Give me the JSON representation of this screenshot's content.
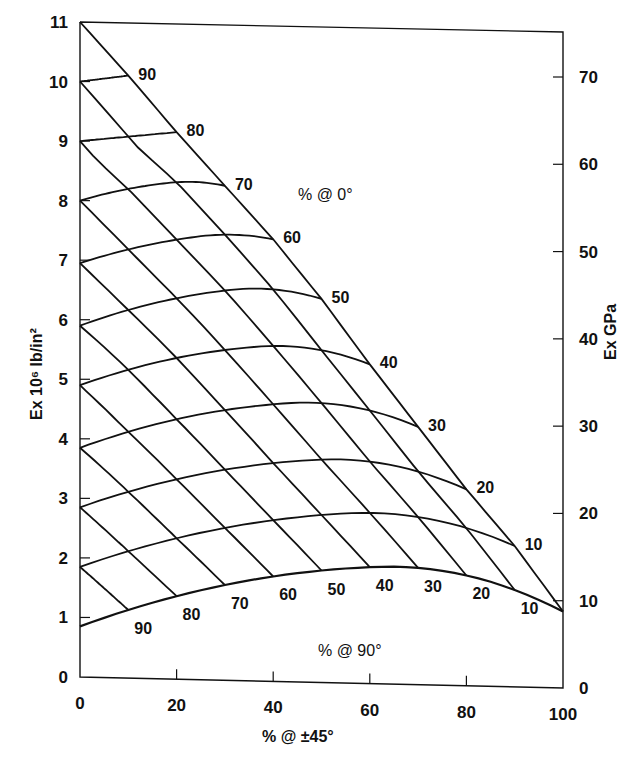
{
  "chart_data": {
    "type": "line",
    "subtype": "carpet-plot",
    "title": "",
    "xlabel": "% @ ±45°",
    "ylabel_left": "Ex 10⁶ lb/in²",
    "ylabel_right": "Ex GPa",
    "xlim": [
      0,
      100
    ],
    "ylim_left": [
      0,
      11
    ],
    "ylim_right": [
      0,
      75
    ],
    "x_ticks": [
      0,
      20,
      40,
      60,
      80,
      100
    ],
    "y_ticks_left": [
      0,
      1,
      2,
      3,
      4,
      5,
      6,
      7,
      8,
      9,
      10,
      11
    ],
    "y_ticks_right": [
      0,
      10,
      20,
      30,
      40,
      50,
      60,
      70
    ],
    "grid": false,
    "region_labels": {
      "zero_deg": "% @ 0°",
      "ninety_deg": "% @ 90°"
    },
    "family_0deg": {
      "name": "% @ 0°",
      "labels": [
        "90",
        "80",
        "70",
        "60",
        "50",
        "40",
        "30",
        "20",
        "10"
      ],
      "values": [
        90,
        80,
        70,
        60,
        50,
        40,
        30,
        20,
        10,
        0
      ],
      "left_intercepts_msi": [
        10.0,
        9.0,
        8.0,
        6.95,
        5.9,
        4.9,
        3.85,
        2.85,
        1.85,
        0.85
      ],
      "edge_values_msi": [
        10.1,
        9.15,
        8.25,
        7.35,
        6.35,
        5.25,
        4.2,
        3.15,
        2.2,
        1.1
      ],
      "peak_values_msi": [
        10.0,
        9.05,
        8.3,
        7.4,
        6.5,
        5.55,
        4.6,
        3.65,
        2.75,
        1.85
      ]
    },
    "family_90deg": {
      "name": "% @ 90°",
      "labels": [
        "90",
        "80",
        "70",
        "60",
        "50",
        "40",
        "30",
        "20",
        "10"
      ],
      "values": [
        90,
        80,
        70,
        60,
        50,
        40,
        30,
        20,
        10
      ]
    },
    "boundary": {
      "top_point": {
        "x": 0,
        "y_msi": 11.0
      },
      "end_point": {
        "x": 100,
        "y_msi": 1.1
      }
    }
  }
}
